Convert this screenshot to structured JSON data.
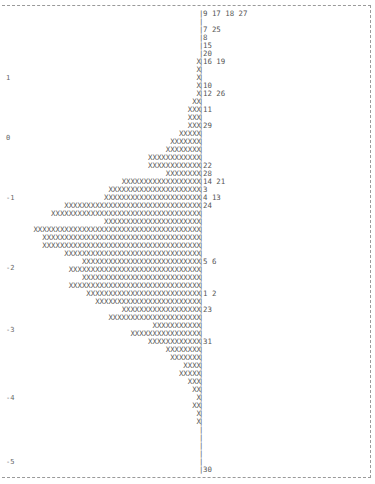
{
  "chart_data": {
    "type": "bar",
    "orientation": "horizontal",
    "title": "",
    "xlabel": "",
    "ylabel": "",
    "y_ticks": [
      "1",
      "0",
      "-1",
      "-2",
      "-3",
      "-4",
      "-5"
    ],
    "ylim": [
      -5,
      1.5
    ],
    "bar_char": "X",
    "separator_char": "|",
    "rows": [
      {
        "count": 0,
        "ids": "9 17 18 27"
      },
      {
        "count": 0,
        "ids": ""
      },
      {
        "count": 0,
        "ids": "7 25"
      },
      {
        "count": 0,
        "ids": "8"
      },
      {
        "count": 0,
        "ids": "15"
      },
      {
        "count": 0,
        "ids": "20"
      },
      {
        "count": 1,
        "ids": "16 19"
      },
      {
        "count": 1,
        "ids": ""
      },
      {
        "count": 1,
        "ids": ""
      },
      {
        "count": 1,
        "ids": "10"
      },
      {
        "count": 1,
        "ids": "12 26"
      },
      {
        "count": 2,
        "ids": ""
      },
      {
        "count": 3,
        "ids": "11"
      },
      {
        "count": 3,
        "ids": ""
      },
      {
        "count": 3,
        "ids": "29"
      },
      {
        "count": 5,
        "ids": ""
      },
      {
        "count": 7,
        "ids": ""
      },
      {
        "count": 8,
        "ids": ""
      },
      {
        "count": 12,
        "ids": ""
      },
      {
        "count": 12,
        "ids": "22"
      },
      {
        "count": 8,
        "ids": "28"
      },
      {
        "count": 18,
        "ids": "14 21"
      },
      {
        "count": 21,
        "ids": "3"
      },
      {
        "count": 22,
        "ids": "4 13"
      },
      {
        "count": 31,
        "ids": "24"
      },
      {
        "count": 34,
        "ids": ""
      },
      {
        "count": 22,
        "ids": ""
      },
      {
        "count": 38,
        "ids": ""
      },
      {
        "count": 36,
        "ids": ""
      },
      {
        "count": 36,
        "ids": ""
      },
      {
        "count": 31,
        "ids": ""
      },
      {
        "count": 27,
        "ids": "5 6"
      },
      {
        "count": 30,
        "ids": ""
      },
      {
        "count": 27,
        "ids": ""
      },
      {
        "count": 30,
        "ids": ""
      },
      {
        "count": 26,
        "ids": "1 2"
      },
      {
        "count": 24,
        "ids": ""
      },
      {
        "count": 18,
        "ids": "23"
      },
      {
        "count": 21,
        "ids": ""
      },
      {
        "count": 11,
        "ids": ""
      },
      {
        "count": 16,
        "ids": ""
      },
      {
        "count": 12,
        "ids": "31"
      },
      {
        "count": 8,
        "ids": ""
      },
      {
        "count": 7,
        "ids": ""
      },
      {
        "count": 4,
        "ids": ""
      },
      {
        "count": 5,
        "ids": ""
      },
      {
        "count": 3,
        "ids": ""
      },
      {
        "count": 2,
        "ids": ""
      },
      {
        "count": 1,
        "ids": ""
      },
      {
        "count": 2,
        "ids": ""
      },
      {
        "count": 1,
        "ids": ""
      },
      {
        "count": 1,
        "ids": ""
      },
      {
        "count": 0,
        "ids": ""
      },
      {
        "count": 0,
        "ids": ""
      },
      {
        "count": 0,
        "ids": ""
      },
      {
        "count": 0,
        "ids": ""
      },
      {
        "count": 0,
        "ids": ""
      },
      {
        "count": 0,
        "ids": "30"
      }
    ],
    "tick_rows": {
      "1": 8,
      "0": 15.5,
      "-1": 23,
      "-2": 31.7,
      "-3": 39.5,
      "-4": 48,
      "-5": 56
    },
    "grid": false,
    "legend": null
  }
}
